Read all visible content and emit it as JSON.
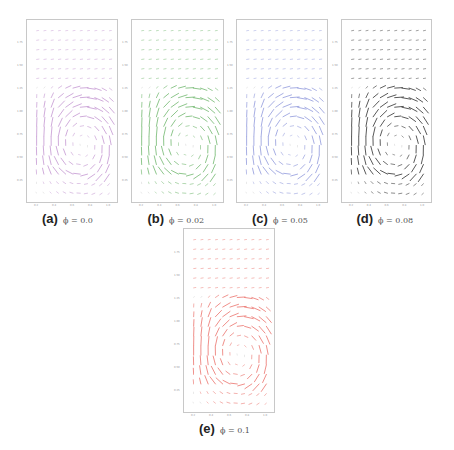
{
  "figure": {
    "panels": [
      {
        "id": "a",
        "label": "(a)",
        "equation": "ϕ = 0.0",
        "color": "#b67fc8",
        "frame": {
          "x": 26,
          "y": 19,
          "w": 92,
          "h": 184
        },
        "intensity": 0.75
      },
      {
        "id": "b",
        "label": "(b)",
        "equation": "ϕ = 0.02",
        "color": "#5fae5c",
        "frame": {
          "x": 131,
          "y": 19,
          "w": 93,
          "h": 184
        },
        "intensity": 0.85
      },
      {
        "id": "c",
        "label": "(c)",
        "equation": "ϕ = 0.05",
        "color": "#7d87d6",
        "frame": {
          "x": 236,
          "y": 19,
          "w": 92,
          "h": 184
        },
        "intensity": 0.8
      },
      {
        "id": "d",
        "label": "(d)",
        "equation": "ϕ = 0.08",
        "color": "#2e2e2e",
        "frame": {
          "x": 341,
          "y": 19,
          "w": 91,
          "h": 184
        },
        "intensity": 1.0
      },
      {
        "id": "e",
        "label": "(e)",
        "equation": "ϕ = 0.1",
        "color": "#e85a52",
        "frame": {
          "x": 183,
          "y": 228,
          "w": 92,
          "h": 185
        },
        "intensity": 0.8
      }
    ]
  },
  "chart_data": {
    "type": "quiver",
    "title": "",
    "xlabel": "",
    "ylabel": "",
    "grid": false,
    "legend": "none",
    "source": "synthetic approximation — NOT read from the image; field was generated from a hand-tuned vortex model chosen to visually match the screenshot",
    "x_ticks": [
      "0.2",
      "0.4",
      "0.6",
      "0.8",
      "1.0"
    ],
    "y_ticks": [
      "0.25",
      "0.50",
      "0.75",
      "1.00",
      "1.25",
      "1.50",
      "1.75"
    ],
    "xlim": [
      0.0,
      1.1
    ],
    "ylim": [
      0.0,
      2.0
    ],
    "grid_size": {
      "cols": 11,
      "rows": 18
    },
    "field_model": {
      "description": "Estimated by eye; parameters are illustrative, not measured. Single clockwise vortex in lower half; weak upward/rightward flow above; near-zero top region.",
      "vortex_center": [
        0.68,
        0.62
      ],
      "vortex_radius": [
        0.38,
        0.52
      ],
      "left_wall_band": [
        0.05,
        0.3
      ],
      "quiet_region_y_above": 1.35
    },
    "series": [
      {
        "name": "ϕ = 0.0",
        "panel": "a",
        "color": "#b67fc8"
      },
      {
        "name": "ϕ = 0.02",
        "panel": "b",
        "color": "#5fae5c"
      },
      {
        "name": "ϕ = 0.05",
        "panel": "c",
        "color": "#7d87d6"
      },
      {
        "name": "ϕ = 0.08",
        "panel": "d",
        "color": "#2e2e2e"
      },
      {
        "name": "ϕ = 0.1",
        "panel": "e",
        "color": "#e85a52"
      }
    ]
  }
}
